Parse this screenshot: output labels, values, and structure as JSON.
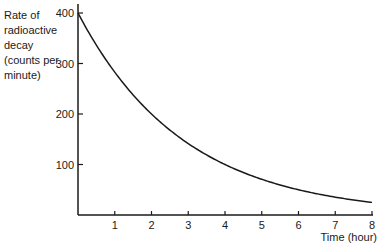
{
  "chart_data": {
    "type": "line",
    "title": "",
    "xlabel": "Time (hour)",
    "ylabel": "Rate of radioactive decay (counts per minute)",
    "ylabel_lines": [
      "Rate of",
      "radioactive",
      "decay",
      "(counts per",
      "minute)"
    ],
    "x_ticks": [
      1,
      2,
      3,
      4,
      5,
      6,
      7,
      8
    ],
    "y_ticks": [
      100,
      200,
      300,
      400
    ],
    "xlim": [
      0,
      8
    ],
    "ylim": [
      0,
      400
    ],
    "grid": false,
    "series": [
      {
        "name": "decay curve",
        "x": [
          0,
          1,
          2,
          3,
          4,
          5,
          6,
          7,
          8
        ],
        "values": [
          400,
          283,
          200,
          141,
          100,
          71,
          50,
          35,
          25
        ]
      }
    ],
    "half_life_hours": 2
  }
}
